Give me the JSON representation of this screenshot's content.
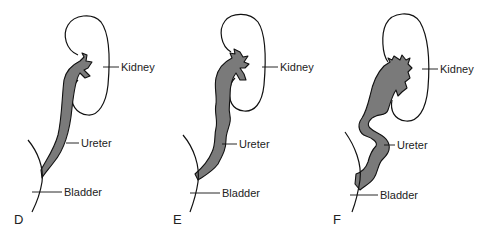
{
  "figure": {
    "fill_color": "#7a7a7a",
    "stroke_color": "#111111",
    "panels": [
      {
        "id": "D",
        "label": "D",
        "description": "Normal ureter",
        "annotations": {
          "kidney": "Kidney",
          "ureter": "Ureter",
          "bladder": "Bladder"
        }
      },
      {
        "id": "E",
        "label": "E",
        "description": "Mildly dilated, slightly tortuous ureter",
        "annotations": {
          "kidney": "Kidney",
          "ureter": "Ureter",
          "bladder": "Bladder"
        }
      },
      {
        "id": "F",
        "label": "F",
        "description": "Markedly dilated renal pelvis and tortuous ureter",
        "annotations": {
          "kidney": "Kidney",
          "ureter": "Ureter",
          "bladder": "Bladder"
        }
      }
    ]
  }
}
